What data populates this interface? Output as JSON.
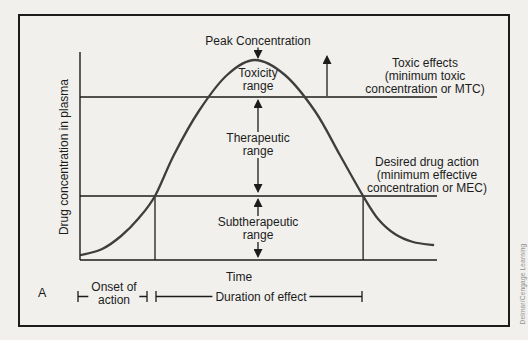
{
  "page": {
    "background": "#f1f0ec",
    "ink": "#1c1c1c",
    "curve_color": "#3e3e3e",
    "credit_color": "#8f8f8f"
  },
  "figure": {
    "panel_label": "A",
    "credit": "Delmar/Cengage Learning",
    "x_axis_label": "Time",
    "y_axis_label": "Drug concentration in plasma"
  },
  "annotations": {
    "peak": "Peak Concentration",
    "toxicity_range": {
      "line1": "Toxicity",
      "line2": "range"
    },
    "therapeutic_range": {
      "line1": "Therapeutic",
      "line2": "range"
    },
    "subtherapeutic_range": {
      "line1": "Subtherapeutic",
      "line2": "range"
    },
    "toxic_effects": {
      "line1": "Toxic effects",
      "line2": "(minimum toxic",
      "line3": "concentration or MTC)"
    },
    "desired_action": {
      "line1": "Desired drug action",
      "line2": "(minimum effective",
      "line3": "concentration or MEC)"
    },
    "onset": {
      "line1": "Onset of",
      "line2": "action"
    },
    "duration": "Duration of effect"
  },
  "chart_data": {
    "type": "line",
    "title": "",
    "xlabel": "Time",
    "ylabel": "Drug concentration in plasma",
    "axes_numeric": false,
    "x_range": [
      0,
      1
    ],
    "y_range": [
      0,
      1.1
    ],
    "series": [
      {
        "name": "drug plasma concentration",
        "x": [
          0.003,
          0.062,
          0.115,
          0.165,
          0.21,
          0.263,
          0.333,
          0.412,
          0.49,
          0.574,
          0.658,
          0.728,
          0.793,
          0.835,
          0.882,
          0.933,
          0.989
        ],
        "y": [
          0.025,
          0.055,
          0.12,
          0.21,
          0.32,
          0.525,
          0.745,
          0.925,
          1.0,
          0.925,
          0.745,
          0.525,
          0.32,
          0.205,
          0.13,
          0.09,
          0.075
        ]
      }
    ],
    "reference_lines": [
      {
        "label": "MTC (minimum toxic concentration)",
        "y": 0.815
      },
      {
        "label": "MEC (minimum effective concentration)",
        "y": 0.32
      }
    ],
    "vertical_markers": [
      {
        "label": "curve rises above MEC",
        "x": 0.21,
        "y_top": 0.32
      },
      {
        "label": "curve falls below MEC",
        "x": 0.793,
        "y_top": 0.32
      }
    ],
    "intervals": [
      {
        "label": "Onset of action",
        "x_start": 0.0,
        "x_end": 0.19
      },
      {
        "label": "Duration of effect",
        "x_start": 0.21,
        "x_end": 0.79
      }
    ],
    "regions": [
      {
        "label": "Toxicity range",
        "y_above": 0.815
      },
      {
        "label": "Therapeutic range",
        "y_between": [
          0.32,
          0.815
        ]
      },
      {
        "label": "Subtherapeutic range",
        "y_below": 0.32
      }
    ]
  }
}
